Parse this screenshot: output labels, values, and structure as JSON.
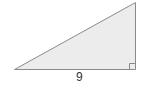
{
  "diagram": {
    "shape": "right-triangle",
    "fill": "#ececec",
    "stroke": "#8a8a8a",
    "base_label": "9",
    "right_angle_marker": "bottom-right"
  }
}
